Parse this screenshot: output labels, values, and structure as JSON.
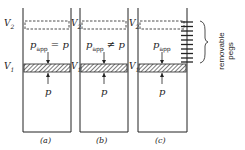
{
  "panels": [
    {
      "id": "a",
      "caption": "(a)",
      "v2": "V",
      "v2_sub": "2",
      "v1": "V",
      "v1_sub": "1",
      "papp_label": "p",
      "papp_sub": "app",
      "relation": "= p",
      "p_label": "p",
      "pegs": false
    },
    {
      "id": "b",
      "caption": "(b)",
      "v2": "V",
      "v2_sub": "2",
      "v1": "V",
      "v1_sub": "1",
      "papp_label": "p",
      "papp_sub": "app",
      "relation": "≠ p",
      "p_label": "p",
      "pegs": false
    },
    {
      "id": "c",
      "caption": "(c)",
      "v2": "V",
      "v2_sub": "2",
      "v1": "V",
      "v1_sub": "1",
      "papp_label": "p",
      "papp_sub": "app",
      "relation": "",
      "p_label": "p",
      "pegs": true
    }
  ],
  "annotation": {
    "line1": "removable",
    "line2": "pegs"
  },
  "colors": {
    "ink": "#222222",
    "background": "#ffffff"
  }
}
